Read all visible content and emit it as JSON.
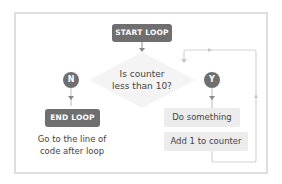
{
  "diagram": {
    "type": "flowchart",
    "start": {
      "label": "START LOOP"
    },
    "decision": {
      "line1": "Is counter",
      "line2": "less than 10?"
    },
    "no_branch": {
      "marker": "N",
      "end": {
        "label": "END LOOP"
      },
      "caption_line1": "Go to the line of",
      "caption_line2": "code after loop"
    },
    "yes_branch": {
      "marker": "Y",
      "steps": [
        {
          "label": "Do something"
        },
        {
          "label": "Add 1 to counter"
        }
      ]
    },
    "colors": {
      "node_dark": "#6f6f6f",
      "node_light": "#ececec",
      "line": "#d4d4d4",
      "frame": "#dedede",
      "text": "#444444"
    }
  }
}
